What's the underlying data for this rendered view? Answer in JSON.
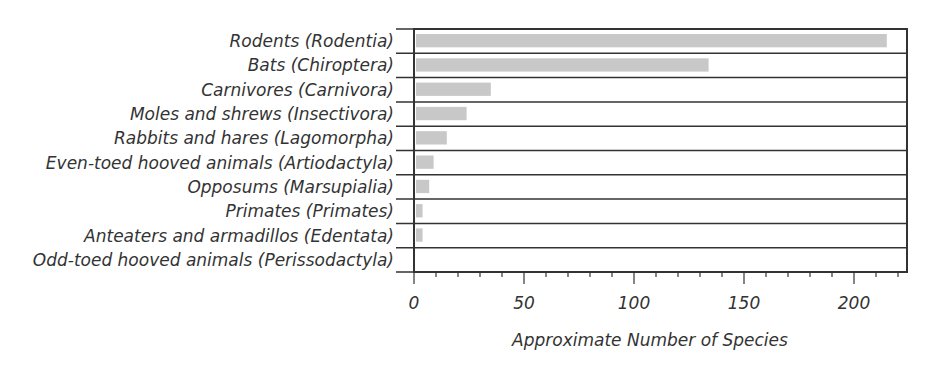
{
  "chart_data": {
    "type": "bar",
    "orientation": "horizontal",
    "title": "",
    "xlabel": "Approximate Number of Species",
    "ylabel": "",
    "categories": [
      "Rodents (Rodentia)",
      "Bats (Chiroptera)",
      "Carnivores (Carnivora)",
      "Moles and shrews (Insectivora)",
      "Rabbits and hares (Lagomorpha)",
      "Even-toed hooved animals (Artiodactyla)",
      "Opposums (Marsupialia)",
      "Primates (Primates)",
      "Anteaters and armadillos (Edentata)",
      "Odd-toed hooved animals (Perissodactyla)"
    ],
    "values": [
      214,
      133,
      34,
      23,
      14,
      8,
      6,
      3,
      3,
      0
    ],
    "xlim": [
      0,
      223
    ],
    "x_ticks": [
      0,
      50,
      100,
      150,
      200
    ],
    "x_minor_tick_step": 10,
    "grid": "horizontal row separators",
    "legend": "none",
    "bar_color": "#c8c8c8"
  }
}
